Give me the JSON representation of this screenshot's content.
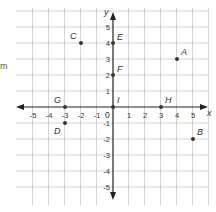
{
  "figure": {
    "type": "coordinate-plane",
    "stray_text": "m",
    "axes": {
      "x_label": "x",
      "y_label": "y",
      "origin_label": "0",
      "x_ticks": [
        -5,
        -4,
        -3,
        -2,
        -1,
        1,
        2,
        3,
        4,
        5
      ],
      "y_ticks": [
        5,
        4,
        3,
        2,
        1,
        -1,
        -2,
        -3,
        -4,
        -5
      ],
      "x_range": [
        -5,
        5
      ],
      "y_range": [
        -5,
        5
      ]
    },
    "points": [
      {
        "label": "A",
        "x": 4,
        "y": 3
      },
      {
        "label": "B",
        "x": 5,
        "y": -2
      },
      {
        "label": "C",
        "x": -2,
        "y": 4
      },
      {
        "label": "D",
        "x": -3,
        "y": -1
      },
      {
        "label": "E",
        "x": 0,
        "y": 4
      },
      {
        "label": "F",
        "x": 0,
        "y": 2
      },
      {
        "label": "G",
        "x": -3,
        "y": 0
      },
      {
        "label": "H",
        "x": 3,
        "y": 0
      },
      {
        "label": "I",
        "x": 0,
        "y": 0
      }
    ],
    "colors": {
      "grid": "#c8c8c8",
      "axis": "#222222",
      "point": "#333333",
      "label": "#333333"
    }
  }
}
